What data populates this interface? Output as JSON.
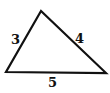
{
  "diagram": {
    "type": "triangle",
    "sides": [
      {
        "label": "3",
        "position": "left"
      },
      {
        "label": "4",
        "position": "right"
      },
      {
        "label": "5",
        "position": "bottom"
      }
    ],
    "stroke_color": "#111111"
  }
}
